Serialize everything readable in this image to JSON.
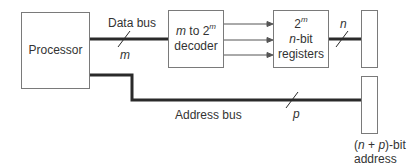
{
  "diagram": {
    "processor": {
      "label": "Processor"
    },
    "decoder": {
      "line1_var": "m",
      "line1_rest": " to 2",
      "line1_sup": "m",
      "line2": "decoder"
    },
    "registers": {
      "line1": "2",
      "line1_sup": "m",
      "line2_var": "n",
      "line2_rest": "-bit",
      "line3": "registers"
    },
    "data_bus": {
      "label": "Data bus",
      "width_label": "m"
    },
    "register_output": {
      "width_label": "n"
    },
    "address_bus": {
      "label": "Address bus",
      "width_label": "p"
    },
    "address": {
      "line1_open": "(",
      "line1_n": "n",
      "line1_plus": " + ",
      "line1_p": "p",
      "line1_close": ")-bit",
      "line2": "address"
    },
    "colors": {
      "line": "#2a2a2a",
      "box_border": "#7a7a7a",
      "arrow": "#555555",
      "text": "#333333"
    }
  }
}
